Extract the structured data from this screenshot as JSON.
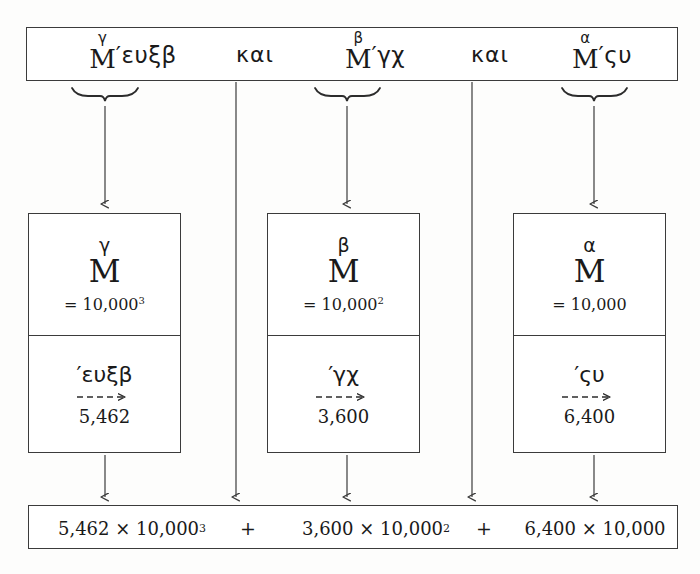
{
  "figure": {
    "background_color": "#fdfdfc",
    "line_color": "#3b3b3b"
  },
  "top_row": {
    "terms": [
      {
        "exponent": "γ",
        "base": "M",
        "numeral": "′ευξβ"
      },
      {
        "exponent": "β",
        "base": "M",
        "numeral": "′γχ"
      },
      {
        "exponent": "α",
        "base": "M",
        "numeral": "′ςυ"
      }
    ],
    "conjunctions": [
      "και",
      "και"
    ]
  },
  "value_boxes": [
    {
      "exponent": "γ",
      "base": "M",
      "equals": "= 10,000",
      "power": "3",
      "greek_numeral": "′ευξβ",
      "arabic_value": "5,462"
    },
    {
      "exponent": "β",
      "base": "M",
      "equals": "= 10,000",
      "power": "2",
      "greek_numeral": "′γχ",
      "arabic_value": "3,600"
    },
    {
      "exponent": "α",
      "base": "M",
      "equals": "= 10,000",
      "power": "",
      "greek_numeral": "′ςυ",
      "arabic_value": "6,400"
    }
  ],
  "bottom_row": {
    "products": [
      {
        "coefficient": "5,462",
        "times": "×",
        "base": "10,000",
        "power": "3"
      },
      {
        "coefficient": "3,600",
        "times": "×",
        "base": "10,000",
        "power": "2"
      },
      {
        "coefficient": "6,400",
        "times": "×",
        "base": "10,000",
        "power": ""
      }
    ],
    "operators": [
      "+",
      "+"
    ]
  }
}
